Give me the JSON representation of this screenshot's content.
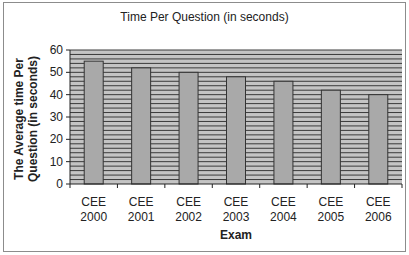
{
  "chart_data": {
    "type": "bar",
    "title": "Time Per Question (in seconds)",
    "xlabel": "Exam",
    "ylabel": "The Average time Per Question (in seconds)",
    "ylabel_lines": [
      "The Average time Per",
      "Question (in seconds)"
    ],
    "categories": [
      "CEE 2000",
      "CEE 2001",
      "CEE 2002",
      "CEE 2003",
      "CEE 2004",
      "CEE 2005",
      "CEE 2006"
    ],
    "category_lines": [
      [
        "CEE",
        "2000"
      ],
      [
        "CEE",
        "2001"
      ],
      [
        "CEE",
        "2002"
      ],
      [
        "CEE",
        "2003"
      ],
      [
        "CEE",
        "2004"
      ],
      [
        "CEE",
        "2005"
      ],
      [
        "CEE",
        "2006"
      ]
    ],
    "values": [
      55,
      52,
      50,
      48,
      46,
      42,
      40
    ],
    "ylim": [
      0,
      60
    ],
    "yticks": [
      0,
      10,
      20,
      30,
      40,
      50,
      60
    ],
    "grid": true,
    "grid_step": 2,
    "legend": null
  },
  "colors": {
    "plot_bg": "#c4c4c4",
    "grid_line": "#3a3a3a",
    "bar_fill": "#a9a9a9",
    "bar_stroke": "#333333",
    "frame_border": "#8c8c8c"
  }
}
